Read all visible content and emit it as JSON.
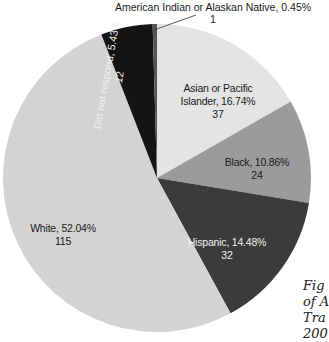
{
  "chart_data": {
    "type": "pie",
    "title": "",
    "start_angle_deg": 0,
    "direction": "clockwise",
    "slices": [
      {
        "label": "Asian or Pacific Islander",
        "percent": 16.74,
        "count": 37,
        "color": "#e4e4e4"
      },
      {
        "label": "Black",
        "percent": 10.86,
        "count": 24,
        "color": "#9b9b9b"
      },
      {
        "label": "Hispanic",
        "percent": 14.48,
        "count": 32,
        "color": "#3b3b3b"
      },
      {
        "label": "White",
        "percent": 52.04,
        "count": 115,
        "color": "#d3d3d3"
      },
      {
        "label": "Did not respond",
        "percent": 5.43,
        "count": 12,
        "color": "#141414"
      },
      {
        "label": "American Indian or Alaskan Native",
        "percent": 0.45,
        "count": 1,
        "color": "#555555"
      }
    ]
  },
  "labels": {
    "asian_line1": "Asian or Pacific",
    "asian_line2": "Islander, 16.74%",
    "asian_count": "37",
    "black_line1": "Black, 10.86%",
    "black_count": "24",
    "hispanic_line1": "Hispanic, 14.48%",
    "hispanic_count": "32",
    "white_line1": "White, 52.04%",
    "white_count": "115",
    "dnr_line1": "Did not respond, 5.43%",
    "dnr_count": "12",
    "ami_line1": "American Indian or Alaskan Native, 0.45%",
    "ami_count": "1"
  },
  "caption": {
    "line1": "Fig",
    "line2": "of A",
    "line3": "Tra",
    "line4": "200"
  }
}
